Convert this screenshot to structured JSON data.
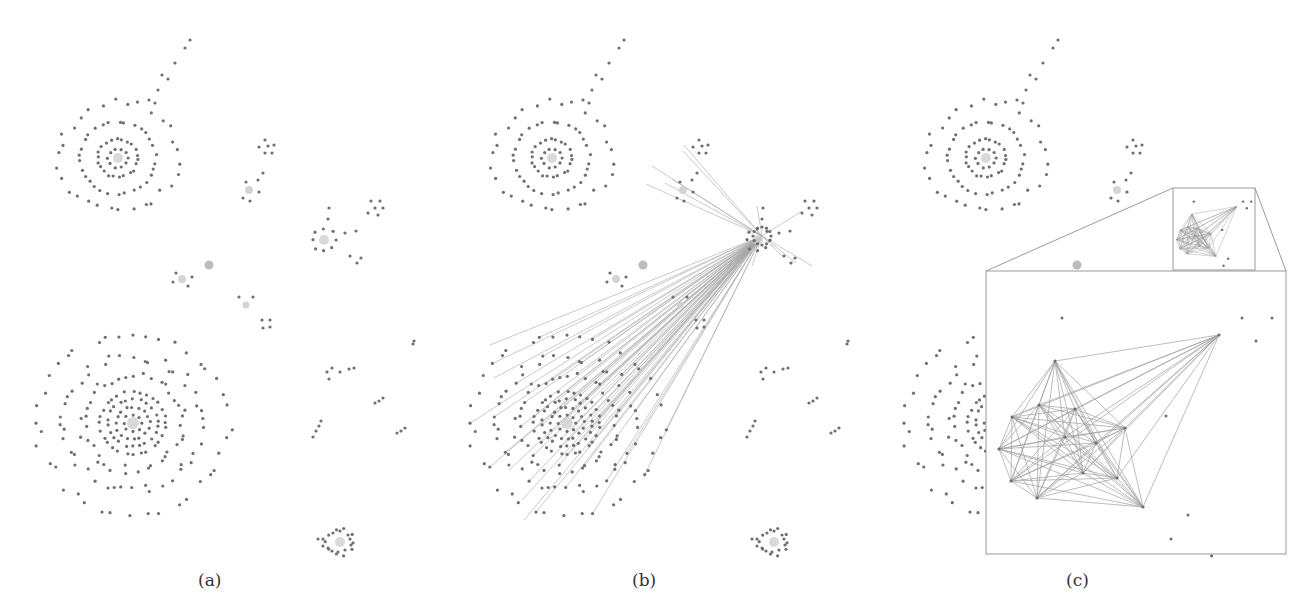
{
  "figure": {
    "panels": [
      {
        "id": "a",
        "label": "(a)",
        "label_x": 210,
        "offset_x": 0,
        "edges": "none"
      },
      {
        "id": "b",
        "label": "(b)",
        "label_x": 644,
        "offset_x": 434,
        "edges": "fan"
      },
      {
        "id": "c",
        "label": "(c)",
        "label_x": 1077,
        "offset_x": 868,
        "edges": "zoom-inset"
      }
    ],
    "colors": {
      "node": "#6f6f6f",
      "hub": "#cfcfcf",
      "hub_dark": "#b5b5b5",
      "edge": "#8a8a8a",
      "inset_border": "#9a9a9a",
      "background": "#ffffff"
    },
    "layout": {
      "clusters": [
        {
          "name": "top-cluster",
          "cx": 118,
          "cy": 158,
          "rings": [
            [
              10,
              10
            ],
            [
              20,
              22
            ],
            [
              38,
              30
            ],
            [
              58,
              30
            ]
          ]
        },
        {
          "name": "bottom-cluster",
          "cx": 133,
          "cy": 423,
          "rings": [
            [
              9,
              8
            ],
            [
              17,
              16
            ],
            [
              25,
              22
            ],
            [
              33,
              28
            ],
            [
              50,
              40
            ],
            [
              70,
              44
            ],
            [
              95,
              40
            ]
          ]
        },
        {
          "name": "small-ring",
          "cx": 340,
          "cy": 542,
          "rings": [
            [
              14,
              10
            ]
          ]
        },
        {
          "name": "mid-ring",
          "cx": 324,
          "cy": 240,
          "rings": [
            [
              12,
              8
            ]
          ]
        }
      ],
      "hubs": [
        {
          "x": 209,
          "y": 265,
          "r": 4.5,
          "dark": true
        },
        {
          "x": 182,
          "y": 279,
          "r": 4,
          "dark": false
        },
        {
          "x": 249,
          "y": 190,
          "r": 4,
          "dark": false
        },
        {
          "x": 246,
          "y": 305,
          "r": 3.5,
          "dark": false
        }
      ],
      "groups": [
        [
          [
            190,
            40
          ],
          [
            185,
            48
          ],
          [
            175,
            63
          ],
          [
            162,
            75
          ],
          [
            168,
            79
          ],
          [
            158,
            90
          ],
          [
            149,
            100
          ],
          [
            155,
            103
          ]
        ],
        [
          [
            265,
            140
          ],
          [
            259,
            147
          ],
          [
            268,
            146
          ],
          [
            274,
            145
          ],
          [
            265,
            153
          ],
          [
            272,
            153
          ]
        ],
        [
          [
            263,
            173
          ],
          [
            258,
            180
          ],
          [
            246,
            182
          ],
          [
            259,
            192
          ],
          [
            243,
            198
          ],
          [
            250,
            201
          ]
        ],
        [
          [
            371,
            201
          ],
          [
            380,
            201
          ],
          [
            375,
            208
          ],
          [
            383,
            208
          ],
          [
            368,
            213
          ],
          [
            378,
            215
          ]
        ],
        [
          [
            329,
            208
          ],
          [
            328,
            219
          ],
          [
            345,
            233
          ],
          [
            356,
            231
          ],
          [
            350,
            256
          ],
          [
            361,
            258
          ],
          [
            357,
            263
          ]
        ],
        [
          [
            176,
            273
          ],
          [
            192,
            277
          ],
          [
            173,
            282
          ],
          [
            188,
            286
          ]
        ],
        [
          [
            239,
            297
          ],
          [
            253,
            297
          ],
          [
            262,
            320
          ],
          [
            270,
            320
          ],
          [
            263,
            328
          ],
          [
            270,
            327
          ]
        ],
        [
          [
            414,
            341
          ],
          [
            413,
            344
          ]
        ],
        [
          [
            327,
            372
          ],
          [
            332,
            368
          ],
          [
            340,
            372
          ],
          [
            349,
            369
          ],
          [
            354,
            368
          ],
          [
            329,
            379
          ]
        ],
        [
          [
            375,
            403
          ],
          [
            379,
            401
          ],
          [
            383,
            398
          ]
        ],
        [
          [
            397,
            433
          ],
          [
            401,
            431
          ],
          [
            405,
            428
          ]
        ],
        [
          [
            313,
            437
          ],
          [
            316,
            431
          ],
          [
            319,
            426
          ],
          [
            321,
            421
          ]
        ],
        [
          [
            318,
            539
          ],
          [
            323,
            539
          ],
          [
            323,
            546
          ],
          [
            328,
            548
          ],
          [
            338,
            552
          ],
          [
            345,
            550
          ],
          [
            351,
            545
          ],
          [
            350,
            539
          ],
          [
            348,
            535
          ],
          [
            340,
            531
          ],
          [
            333,
            533
          ],
          [
            332,
            551
          ]
        ]
      ],
      "fan": {
        "hub_x": 328,
        "hub_y": 236,
        "targets_lower": 44,
        "targets_upper": [
          [
            -79,
            -85
          ],
          [
            -78,
            -91
          ],
          [
            -110,
            -70
          ],
          [
            -97,
            -53
          ],
          [
            -90,
            -57
          ],
          [
            -116,
            -52
          ]
        ],
        "targets_right": [
          [
            40,
            -25
          ],
          [
            34,
            27
          ],
          [
            50,
            30
          ],
          [
            20,
            20
          ],
          [
            -10,
            30
          ],
          [
            -5,
            -30
          ]
        ]
      },
      "inset": {
        "small": {
          "x": 1173,
          "y": 188,
          "w": 82,
          "h": 82
        },
        "large": {
          "x": 986,
          "y": 271,
          "w": 300,
          "h": 283
        },
        "connector_left_from": [
          1173,
          188
        ],
        "connector_right_from": [
          1255,
          188
        ],
        "nodes": [
          [
            1055,
            361
          ],
          [
            1039,
            405
          ],
          [
            1075,
            409
          ],
          [
            1012,
            417
          ],
          [
            999,
            449
          ],
          [
            1011,
            481
          ],
          [
            1037,
            498
          ],
          [
            1125,
            428
          ],
          [
            1143,
            507
          ],
          [
            1219,
            335
          ],
          [
            1065,
            437
          ],
          [
            1096,
            443
          ],
          [
            1083,
            473
          ],
          [
            1117,
            478
          ]
        ],
        "extra_points": [
          [
            1062,
            318
          ],
          [
            1242,
            318
          ],
          [
            1272,
            318
          ],
          [
            1166,
            416
          ],
          [
            1188,
            515
          ],
          [
            1171,
            539
          ],
          [
            1256,
            341
          ]
        ]
      }
    }
  }
}
